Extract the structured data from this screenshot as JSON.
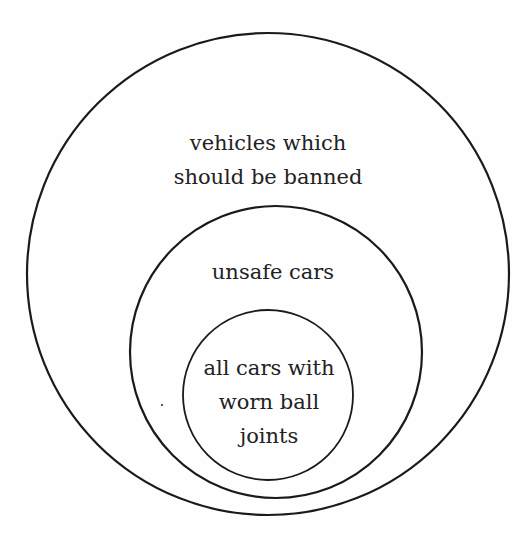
{
  "diagram": {
    "type": "nested-euler-circles",
    "stroke_color": "#1a1a1a",
    "text_color": "#222222",
    "background": "#fefefe",
    "sets": [
      {
        "id": "outer",
        "lines": [
          "vehicles which",
          "should be banned"
        ],
        "circle": {
          "cx": 268,
          "cy": 274,
          "r": 241
        }
      },
      {
        "id": "middle",
        "lines": [
          "unsafe cars"
        ],
        "circle": {
          "cx": 276,
          "cy": 352,
          "r": 146
        }
      },
      {
        "id": "inner",
        "lines": [
          "all cars with",
          "worn ball",
          "joints"
        ],
        "circle": {
          "cx": 268,
          "cy": 395,
          "r": 85
        }
      }
    ]
  }
}
